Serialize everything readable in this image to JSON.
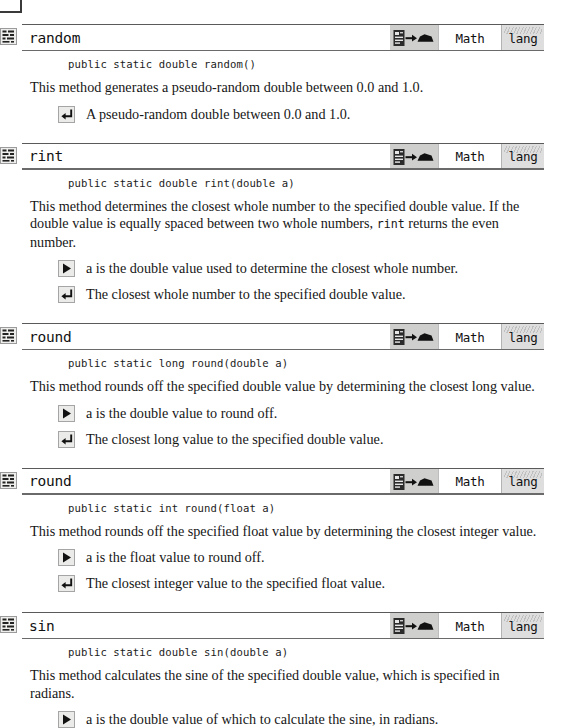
{
  "page": {
    "kind": "java-api-reference-page",
    "icons": {
      "class_icon": "class-grid-icon",
      "signature_icon": "method-signature-icon",
      "param_icon": "parameter-triangle-icon",
      "return_icon": "return-arrow-icon"
    },
    "colors": {
      "rule": "#5a5a5a",
      "icon_cell_bg": "#cfcfcd",
      "pkg_cell_bg": "#dedede",
      "text": "#161616"
    }
  },
  "entries": [
    {
      "name": "random",
      "owner": "Math",
      "package": "lang",
      "signature": "public static double random()",
      "description": "This method generates a pseudo-random double between 0.0 and 1.0.",
      "notes": [
        {
          "type": "return",
          "text": "A pseudo-random double between 0.0 and 1.0."
        }
      ]
    },
    {
      "name": "rint",
      "owner": "Math",
      "package": "lang",
      "signature": "public static double rint(double a)",
      "description": "This method determines the closest whole number to the specified double value. If the double value is equally spaced between two whole numbers, rint returns the even number.",
      "description_parts": [
        {
          "t": "This method determines the closest whole number to the specified double value. If the double value is equally spaced between two whole numbers, ",
          "mono": false
        },
        {
          "t": "rint",
          "mono": true
        },
        {
          "t": " returns the even number.",
          "mono": false
        }
      ],
      "notes": [
        {
          "type": "param",
          "text": "a is the double value used to determine the closest whole number."
        },
        {
          "type": "return",
          "text": "The closest whole number to the specified double value."
        }
      ]
    },
    {
      "name": "round",
      "owner": "Math",
      "package": "lang",
      "signature": "public static long round(double a)",
      "description": "This method rounds off the specified double value by determining the closest long value.",
      "notes": [
        {
          "type": "param",
          "text": "a is the double value to round off."
        },
        {
          "type": "return",
          "text": "The closest long value to the specified double value."
        }
      ]
    },
    {
      "name": "round",
      "owner": "Math",
      "package": "lang",
      "signature": "public static int round(float a)",
      "description": "This method rounds off the specified float value by determining the closest integer value.",
      "notes": [
        {
          "type": "param",
          "text": "a is the float value to round off."
        },
        {
          "type": "return",
          "text": "The closest integer value to the specified float value."
        }
      ]
    },
    {
      "name": "sin",
      "owner": "Math",
      "package": "lang",
      "signature": "public static double sin(double a)",
      "description": "This method calculates the sine of the specified double value, which is specified in radians.",
      "notes": [
        {
          "type": "param",
          "text": "a is the double value of which to calculate the sine, in radians."
        }
      ]
    }
  ]
}
